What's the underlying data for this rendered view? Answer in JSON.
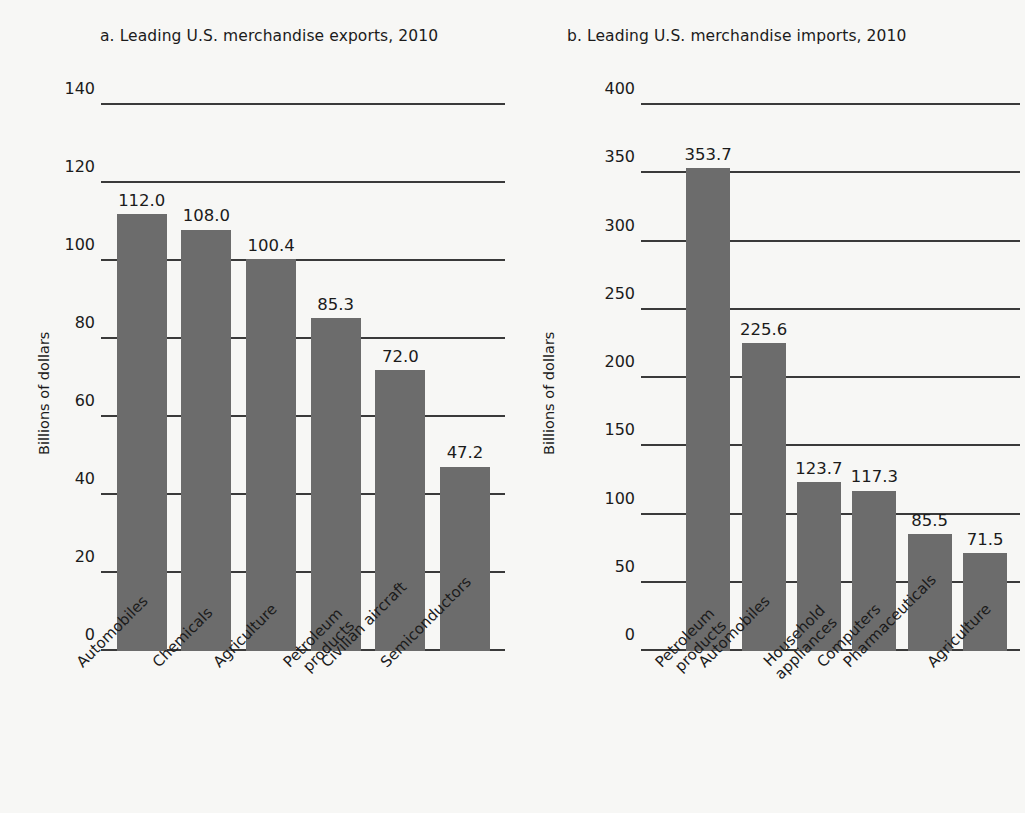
{
  "chart_data": [
    {
      "id": "exports",
      "type": "bar",
      "title": "a. Leading U.S. merchandise exports, 2010",
      "xlabel": "",
      "ylabel": "Billions of dollars",
      "ylim": [
        0,
        140
      ],
      "yticks": [
        0,
        20,
        40,
        60,
        80,
        100,
        120,
        140
      ],
      "grid": true,
      "legend": "none",
      "bar_color": "#6c6c6c",
      "categories": [
        "Automobiles",
        "Chemicals",
        "Agriculture",
        "Petroleum\nproducts",
        "Civilian aircraft",
        "Semiconductors"
      ],
      "category_lines": [
        [
          "Automobiles"
        ],
        [
          "Chemicals"
        ],
        [
          "Agriculture"
        ],
        [
          "Petroleum",
          "products"
        ],
        [
          "Civilian aircraft"
        ],
        [
          "Semiconductors"
        ]
      ],
      "values": [
        112.0,
        108.0,
        100.4,
        85.3,
        72.0,
        47.2
      ],
      "value_labels": [
        "112.0",
        "108.0",
        "100.4",
        "85.3",
        "72.0",
        "47.2"
      ]
    },
    {
      "id": "imports",
      "type": "bar",
      "title": "b. Leading U.S. merchandise imports, 2010",
      "xlabel": "",
      "ylabel": "Billions of dollars",
      "ylim": [
        0,
        400
      ],
      "yticks": [
        0,
        50,
        100,
        150,
        200,
        250,
        300,
        350,
        400
      ],
      "grid": true,
      "legend": "none",
      "bar_color": "#6c6c6c",
      "categories": [
        "Petroleum\nproducts",
        "Automobiles",
        "Household\nappliances",
        "Computers",
        "Pharmaceuticals",
        "Agriculture"
      ],
      "category_lines": [
        [
          "Petroleum",
          "products"
        ],
        [
          "Automobiles"
        ],
        [
          "Household",
          "appliances"
        ],
        [
          "Computers"
        ],
        [
          "Pharmaceuticals"
        ],
        [
          "Agriculture"
        ]
      ],
      "values": [
        353.7,
        225.6,
        123.7,
        117.3,
        85.5,
        71.5
      ],
      "value_labels": [
        "353.7",
        "225.6",
        "123.7",
        "117.3",
        "85.5",
        "71.5"
      ]
    }
  ],
  "panels": {
    "exports": {
      "title": "a. Leading U.S. merchandise exports, 2010",
      "ylabel": "Billions of dollars"
    },
    "imports": {
      "title": "b. Leading U.S. merchandise imports, 2010",
      "ylabel": "Billions of dollars"
    }
  },
  "colors": {
    "background": "#f7f7f5",
    "bar": "#6c6c6c",
    "axis": "#3a3a3a",
    "text": "#1b1b1b"
  }
}
